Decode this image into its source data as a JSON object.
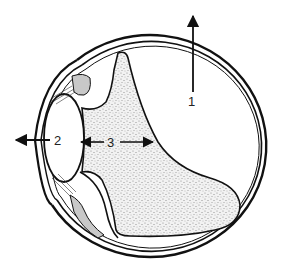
{
  "diagram": {
    "labels": {
      "one": "1",
      "two": "2",
      "three": "3"
    },
    "colors": {
      "line": "#111111",
      "stipple": "#9a9a9a",
      "background": "#ffffff"
    }
  }
}
